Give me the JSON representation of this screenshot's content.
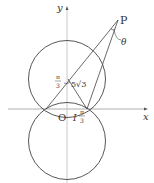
{
  "diagram": {
    "axes": {
      "x_label": "x",
      "y_label": "y",
      "origin_label": "O"
    },
    "points": {
      "P": "P",
      "I": "I"
    },
    "labels": {
      "theta": "θ",
      "angle_top_num": "π",
      "angle_top_den": "3",
      "angle_bottom_num": "π",
      "angle_bottom_den": "3",
      "side": "5√3"
    },
    "colors": {
      "stroke": "#444444",
      "axis": "#999999",
      "text": "#333333"
    }
  }
}
